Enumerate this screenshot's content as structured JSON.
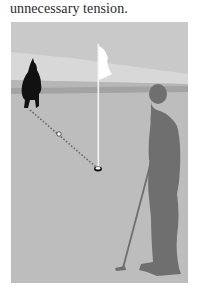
{
  "text": {
    "caption_line": "unnecessary tension."
  },
  "illustration": {
    "description": "Golf putting green illustration: a caddie crouched lining up a putt, a flagstick in the hole, a dotted aim line with a ball marker, and a golfer silhouette holding a putter.",
    "elements": {
      "crouching_figure": "caddie-silhouette",
      "flagstick": "flag-icon",
      "hole": "hole-icon",
      "aim_line": "dotted-line",
      "ball_marker": "ball-icon",
      "golfer": "golfer-silhouette",
      "putter": "putter-icon"
    },
    "colors": {
      "sky": "#c9c9c9",
      "sky_light_band": "#d8d8d8",
      "horizon_band": "#a3a3a3",
      "green": "#bdbdbd",
      "caddie": "#111111",
      "golfer": "#6f6f6f",
      "flag": "#ffffff",
      "aim_line": "#6a6a6a"
    }
  }
}
